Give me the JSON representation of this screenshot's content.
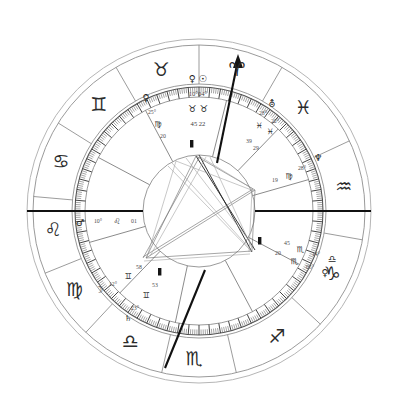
{
  "chart": {
    "type": "natal-wheel",
    "background_color": "#ffffff",
    "ink_color": "#2b2b2b"
  },
  "zodiac_ring": {
    "label": "Outer zodiac sign ring",
    "signs": [
      {
        "name": "Aries",
        "glyph": "♈",
        "angle_deg": 75,
        "label": "Aries"
      },
      {
        "name": "Pisces",
        "glyph": "♓",
        "angle_deg": 45,
        "label": "Pisces"
      },
      {
        "name": "Aquarius",
        "glyph": "♒",
        "angle_deg": 10,
        "label": "Aquarius"
      },
      {
        "name": "Capricorn",
        "glyph": "♑",
        "angle_deg": 335,
        "label": "Capricorn"
      },
      {
        "name": "Sagittarius",
        "glyph": "♐",
        "angle_deg": 302,
        "label": "Sagittarius"
      },
      {
        "name": "Scorpio",
        "glyph": "♏",
        "angle_deg": 268,
        "label": "Scorpio"
      },
      {
        "name": "Libra",
        "glyph": "♎",
        "angle_deg": 242,
        "label": "Libra"
      },
      {
        "name": "Virgo",
        "glyph": "♍",
        "angle_deg": 212,
        "label": "Virgo"
      },
      {
        "name": "Leo",
        "glyph": "♌",
        "angle_deg": 187,
        "label": "Leo"
      },
      {
        "name": "Cancer",
        "glyph": "♋",
        "angle_deg": 160,
        "label": "Cancer"
      },
      {
        "name": "Gemini",
        "glyph": "♊",
        "angle_deg": 133,
        "label": "Gemini"
      },
      {
        "name": "Taurus",
        "glyph": "♉",
        "angle_deg": 105,
        "label": "Taurus"
      }
    ]
  },
  "placements": {
    "label": "Planetary placements written inside the wheel",
    "groups": [
      {
        "id": "top-venus-sun",
        "name": "venus-sun-taurus-group",
        "x": 198,
        "y": 78,
        "rows": [
          {
            "kind": "glyphs",
            "text": "♀  ☉",
            "size": "planet"
          },
          {
            "kind": "degrees",
            "text": "10°04°",
            "size": "deg"
          },
          {
            "kind": "glyphs",
            "text": "♉  ♉",
            "size": "planet"
          },
          {
            "kind": "degrees",
            "text": "45 22",
            "size": "deg"
          }
        ]
      },
      {
        "id": "upper-left-venus",
        "name": "upper-left-venus-group",
        "entries": [
          {
            "text": "♀",
            "x": 146,
            "y": 97,
            "cls": "planet"
          },
          {
            "text": "25°",
            "x": 152,
            "y": 112,
            "cls": "degsm"
          },
          {
            "text": "♍",
            "x": 158,
            "y": 124,
            "cls": "mini"
          },
          {
            "text": "20",
            "x": 163,
            "y": 136,
            "cls": "degsm"
          }
        ]
      },
      {
        "id": "upper-right-uranus",
        "name": "upper-right-uranus-pisces-group",
        "entries": [
          {
            "text": "⛢",
            "x": 272,
            "y": 103,
            "cls": "planet"
          },
          {
            "text": "28°",
            "x": 263,
            "y": 113,
            "cls": "degsm"
          },
          {
            "text": "22°",
            "x": 275,
            "y": 121,
            "cls": "degsm"
          },
          {
            "text": "♓",
            "x": 259,
            "y": 125,
            "cls": "mini"
          },
          {
            "text": "♓",
            "x": 270,
            "y": 131,
            "cls": "mini"
          },
          {
            "text": "39",
            "x": 249,
            "y": 141,
            "cls": "degsm"
          },
          {
            "text": "29",
            "x": 256,
            "y": 148,
            "cls": "degsm"
          }
        ]
      },
      {
        "id": "right-neptune",
        "name": "right-neptune-group",
        "entries": [
          {
            "text": "♆",
            "x": 318,
            "y": 157,
            "cls": "planet"
          },
          {
            "text": "28°",
            "x": 302,
            "y": 168,
            "cls": "degsm"
          },
          {
            "text": "♍",
            "x": 289,
            "y": 176,
            "cls": "mini"
          },
          {
            "text": "19",
            "x": 275,
            "y": 180,
            "cls": "degsm"
          }
        ]
      },
      {
        "id": "left-mars",
        "name": "left-mars-leo-group",
        "entries": [
          {
            "text": "♂",
            "x": 80,
            "y": 222,
            "cls": "planet"
          },
          {
            "text": "10°",
            "x": 98,
            "y": 221,
            "cls": "degsm"
          },
          {
            "text": "♌",
            "x": 117,
            "y": 221,
            "cls": "mini"
          },
          {
            "text": "01",
            "x": 134,
            "y": 221,
            "cls": "degsm"
          }
        ]
      },
      {
        "id": "lower-right-scorpio",
        "name": "lower-right-scorpio-group",
        "entries": [
          {
            "text": "45",
            "x": 287,
            "y": 243,
            "cls": "degsm"
          },
          {
            "text": "20",
            "x": 278,
            "y": 253,
            "cls": "degsm"
          },
          {
            "text": "♏",
            "x": 300,
            "y": 249,
            "cls": "mini"
          },
          {
            "text": "♏",
            "x": 294,
            "y": 261,
            "cls": "mini"
          },
          {
            "text": "14°",
            "x": 316,
            "y": 254,
            "cls": "degsm"
          },
          {
            "text": "05°",
            "x": 310,
            "y": 267,
            "cls": "degsm"
          },
          {
            "text": "♎",
            "x": 332,
            "y": 258,
            "cls": "planet"
          },
          {
            "text": "♀",
            "x": 325,
            "y": 272,
            "cls": "planet"
          }
        ]
      },
      {
        "id": "lower-left-moon",
        "name": "lower-left-moon-gemini-group",
        "entries": [
          {
            "text": "☽",
            "x": 99,
            "y": 289,
            "cls": "planet"
          },
          {
            "text": "12°",
            "x": 113,
            "y": 284,
            "cls": "degsm"
          },
          {
            "text": "♊",
            "x": 128,
            "y": 276,
            "cls": "mini"
          },
          {
            "text": "58",
            "x": 139,
            "y": 267,
            "cls": "degsm"
          },
          {
            "text": "53",
            "x": 155,
            "y": 285,
            "cls": "degsm"
          },
          {
            "text": "♊",
            "x": 146,
            "y": 295,
            "cls": "mini"
          },
          {
            "text": "23°",
            "x": 135,
            "y": 308,
            "cls": "degsm"
          },
          {
            "text": "♄",
            "x": 128,
            "y": 318,
            "cls": "mini"
          }
        ]
      }
    ]
  },
  "axes": {
    "label": "Chart axes",
    "ascendant_descendant": "horizontal-axis",
    "midheaven_arrow": "ascending-arrow-to-aries"
  },
  "geometry": {
    "center_x": 199,
    "center_y": 211,
    "r_outer": 172,
    "r_sign_outer": 168,
    "r_sign_inner": 128,
    "r_tick_outer": 126,
    "r_tick_inner": 116,
    "r_house": 114,
    "r_inner": 56
  }
}
